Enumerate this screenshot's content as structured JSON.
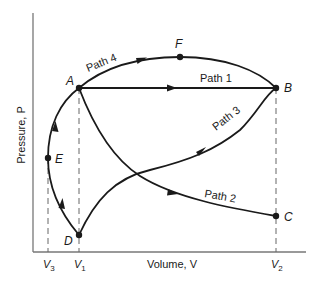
{
  "diagram": {
    "axes": {
      "x_label": "Volume, V",
      "y_label": "Pressure, P",
      "x_ticks": [
        {
          "main": "V",
          "sub": "3"
        },
        {
          "main": "V",
          "sub": "1"
        },
        {
          "main": "V",
          "sub": "2"
        }
      ]
    },
    "points": {
      "A": "A",
      "B": "B",
      "C": "C",
      "D": "D",
      "E": "E",
      "F": "F"
    },
    "paths": {
      "path1": "Path 1",
      "path2": "Path 2",
      "path3": "Path 3",
      "path4": "Path 4"
    },
    "colors": {
      "line": "#1a1a1a",
      "dashed": "#666666",
      "axis": "#777777",
      "background": "#ffffff"
    }
  }
}
